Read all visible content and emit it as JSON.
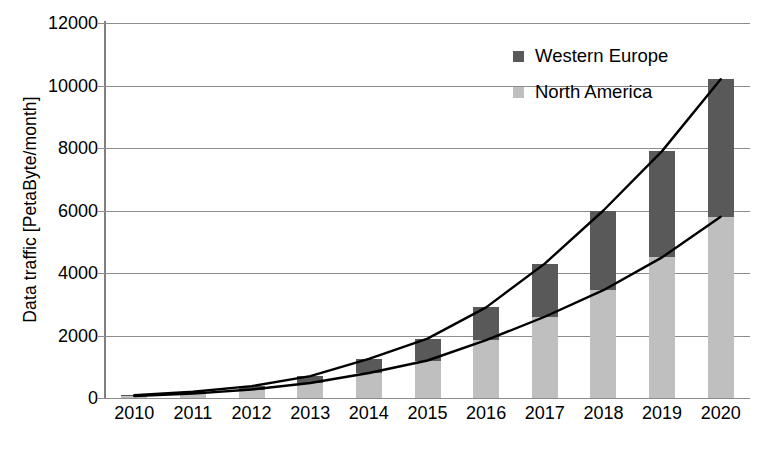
{
  "chart_data": {
    "type": "bar",
    "title": "",
    "subtitle": "",
    "xlabel": "",
    "ylabel": "Data traffic [PetaByte/month]",
    "categories": [
      "2010",
      "2011",
      "2012",
      "2013",
      "2014",
      "2015",
      "2016",
      "2017",
      "2018",
      "2019",
      "2020"
    ],
    "series": [
      {
        "name": "North America",
        "color": "#bfbfbf",
        "values": [
          60,
          140,
          270,
          480,
          800,
          1200,
          1850,
          2600,
          3450,
          4500,
          5800
        ]
      },
      {
        "name": "Western Europe",
        "color": "#595959",
        "values": [
          30,
          60,
          110,
          220,
          450,
          700,
          1050,
          1700,
          2550,
          3400,
          4400
        ]
      }
    ],
    "stacked": true,
    "stack_totals": [
      90,
      200,
      380,
      700,
      1250,
      1900,
      2900,
      4300,
      6000,
      7900,
      10200
    ],
    "overlay_lines": [
      {
        "name": "Stack total trend",
        "color": "#000000",
        "values": [
          90,
          200,
          380,
          700,
          1250,
          1900,
          2900,
          4300,
          6000,
          7900,
          10200
        ]
      },
      {
        "name": "North America trend",
        "color": "#000000",
        "values": [
          60,
          140,
          270,
          480,
          800,
          1200,
          1850,
          2600,
          3450,
          4500,
          5800
        ]
      }
    ],
    "ylim": [
      0,
      12000
    ],
    "ytick_values": [
      0,
      2000,
      4000,
      6000,
      8000,
      10000,
      12000
    ],
    "ytick_labels": [
      "0",
      "2000",
      "4000",
      "6000",
      "8000",
      "10000",
      "12000"
    ],
    "grid": true,
    "grid_axis": "y",
    "legend_position": "top-right",
    "legend": [
      "Western Europe",
      "North America"
    ],
    "colors": {
      "western_europe": "#595959",
      "north_america": "#bfbfbf",
      "gridline": "#8c8c8c",
      "line": "#000000",
      "background": "#ffffff"
    }
  },
  "axis": {
    "y_title": "Data traffic [PetaByte/month]"
  },
  "legend": {
    "items": [
      {
        "label": "Western Europe",
        "swatch": "#595959"
      },
      {
        "label": "North America",
        "swatch": "#bfbfbf"
      }
    ]
  }
}
